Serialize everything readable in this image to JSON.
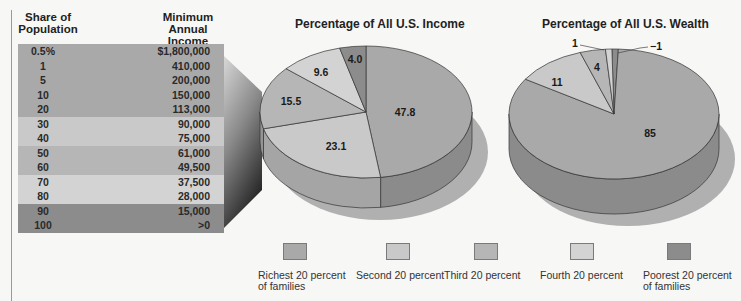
{
  "table": {
    "headers": {
      "share": "Share of Population",
      "income": "Minimum Annual Income"
    },
    "rows": [
      {
        "share": "0.5%",
        "income": "$1,800,000",
        "color": "#a9a9a9"
      },
      {
        "share": "1",
        "income": "410,000",
        "color": "#a9a9a9"
      },
      {
        "share": "5",
        "income": "200,000",
        "color": "#a9a9a9"
      },
      {
        "share": "10",
        "income": "150,000",
        "color": "#a9a9a9"
      },
      {
        "share": "20",
        "income": "113,000",
        "color": "#a9a9a9"
      },
      {
        "share": "30",
        "income": "90,000",
        "color": "#c9c9c9"
      },
      {
        "share": "40",
        "income": "75,000",
        "color": "#c9c9c9"
      },
      {
        "share": "50",
        "income": "61,000",
        "color": "#b6b6b6"
      },
      {
        "share": "60",
        "income": "49,500",
        "color": "#b6b6b6"
      },
      {
        "share": "70",
        "income": "37,500",
        "color": "#d3d3d3"
      },
      {
        "share": "80",
        "income": "28,000",
        "color": "#d3d3d3"
      },
      {
        "share": "90",
        "income": "15,000",
        "color": "#8c8c8c"
      },
      {
        "share": "100",
        "income": ">0",
        "color": "#8c8c8c"
      }
    ]
  },
  "legend": [
    {
      "label": "Richest 20 percent of families",
      "color": "#a9a9a9",
      "x": 283
    },
    {
      "label": "Second 20 percent",
      "color": "#c9c9c9",
      "x": 386
    },
    {
      "label": "Third 20 percent",
      "color": "#b6b6b6",
      "x": 474
    },
    {
      "label": "Fourth 20 percent",
      "color": "#d3d3d3",
      "x": 570
    },
    {
      "label": "Poorest 20 percent of families",
      "color": "#8c8c8c",
      "x": 667
    }
  ],
  "chart_data": [
    {
      "type": "pie",
      "title": "Percentage of All U.S. Income",
      "categories": [
        "Richest 20 percent of families",
        "Second 20 percent",
        "Third 20 percent",
        "Fourth 20 percent",
        "Poorest 20 percent of families"
      ],
      "values": [
        47.8,
        23.1,
        15.5,
        9.6,
        4.0
      ],
      "labels": [
        "47.8",
        "23.1",
        "15.5",
        "9.6",
        "4.0"
      ],
      "colors": [
        "#a9a9a9",
        "#c9c9c9",
        "#b6b6b6",
        "#d3d3d3",
        "#8c8c8c"
      ],
      "style": "3d",
      "legend_position": "bottom"
    },
    {
      "type": "pie",
      "title": "Percentage of All U.S. Wealth",
      "categories": [
        "Richest 20 percent of families",
        "Second 20 percent",
        "Third 20 percent",
        "Fourth 20 percent",
        "Poorest 20 percent of families"
      ],
      "values": [
        85,
        11,
        4,
        1,
        -1
      ],
      "labels": [
        "85",
        "11",
        "4",
        "1",
        "−1"
      ],
      "colors": [
        "#a9a9a9",
        "#c9c9c9",
        "#b6b6b6",
        "#d3d3d3",
        "#8c8c8c"
      ],
      "style": "3d",
      "legend_position": "bottom"
    }
  ]
}
